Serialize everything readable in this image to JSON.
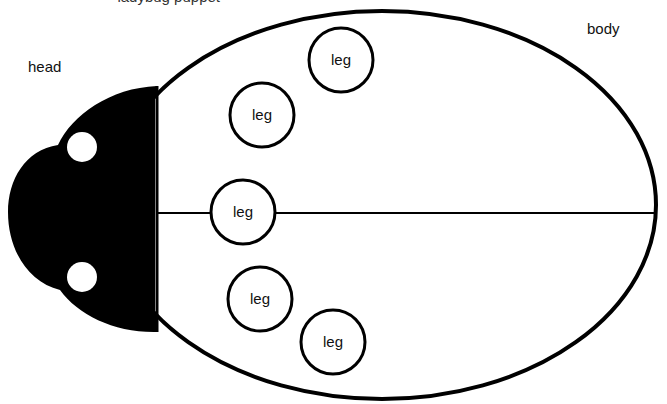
{
  "diagram": {
    "title_clipped": "ladybug puppet",
    "labels": {
      "head": "head",
      "body": "body"
    },
    "legs": [
      {
        "label": "leg",
        "cx": 341,
        "cy": 60,
        "r": 32
      },
      {
        "label": "leg",
        "cx": 262,
        "cy": 115,
        "r": 32
      },
      {
        "label": "leg",
        "cx": 243,
        "cy": 212,
        "r": 32
      },
      {
        "label": "leg",
        "cx": 260,
        "cy": 299,
        "r": 32
      },
      {
        "label": "leg",
        "cx": 333,
        "cy": 342,
        "r": 32
      }
    ],
    "colors": {
      "outline": "#000000",
      "head_fill": "#000000",
      "background": "#ffffff"
    }
  }
}
